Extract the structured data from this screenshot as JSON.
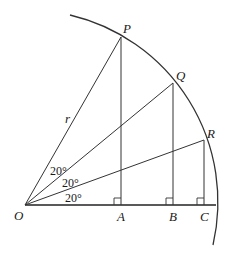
{
  "diagram": {
    "type": "geometry-quarter-circle",
    "origin": {
      "label": "O"
    },
    "radius_label": "r",
    "points": [
      {
        "label": "P",
        "foot": "A",
        "angle_deg": 60
      },
      {
        "label": "Q",
        "foot": "B",
        "angle_deg": 40
      },
      {
        "label": "R",
        "foot": "C",
        "angle_deg": 20
      }
    ],
    "angle_labels": [
      "20°",
      "20°",
      "20°"
    ],
    "colors": {
      "line": "#333333",
      "text": "#1a1a1a",
      "background": "#ffffff"
    }
  }
}
